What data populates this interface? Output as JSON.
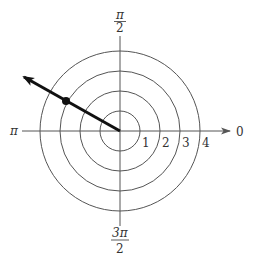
{
  "diagram": {
    "type": "polar-coordinate-grid",
    "pole": {
      "x": 120,
      "y": 131
    },
    "unit_px": 20,
    "circles": [
      1,
      2,
      3,
      4
    ],
    "angle_labels": {
      "right": "0",
      "top_num": "π",
      "top_den": "2",
      "left": "π",
      "bottom_num": "3π",
      "bottom_den": "2"
    },
    "radius_labels": [
      "1",
      "2",
      "3",
      "4"
    ],
    "ray": {
      "angle_deg": 150,
      "angle_label": "5π/6",
      "length_units": 5.0
    },
    "point": {
      "r": 3,
      "theta": "5π/6",
      "theta_deg": 150
    },
    "colors": {
      "grid": "#555555",
      "ray": "#111111",
      "text": "#333333",
      "background": "#ffffff"
    }
  }
}
